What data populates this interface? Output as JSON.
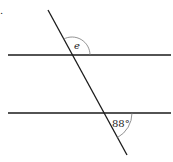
{
  "diagram": {
    "type": "parallel-lines-transversal",
    "corner_mark": ".",
    "lines": {
      "upper_parallel": {
        "x1": 8,
        "y1": 55,
        "x2": 171,
        "y2": 55
      },
      "lower_parallel": {
        "x1": 8,
        "y1": 113,
        "x2": 171,
        "y2": 113
      },
      "transversal": {
        "x1": 48,
        "y1": 10,
        "x2": 127,
        "y2": 155
      }
    },
    "angles": [
      {
        "name": "e",
        "label": "e",
        "at": "upper intersection, above-right"
      },
      {
        "name": "given",
        "label": "88°",
        "at": "lower intersection, below-right"
      }
    ],
    "colors": {
      "line": "#1a1a1a",
      "arc": "#777777",
      "text": "#222222"
    }
  }
}
